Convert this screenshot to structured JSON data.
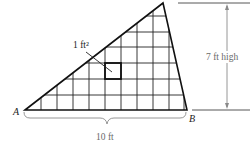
{
  "figure": {
    "vertices": {
      "A": "A",
      "B": "B"
    },
    "labels": {
      "unit_square": "1 ft²",
      "height": "7 ft high",
      "base": "10 ft"
    },
    "grid": {
      "unit": "1 ft",
      "columns": 10,
      "rows": 7
    },
    "colors": {
      "outline": "#111111",
      "grid": "#222222",
      "dimension": "#8a8a8a",
      "label_gray": "#6a6a6a"
    }
  }
}
